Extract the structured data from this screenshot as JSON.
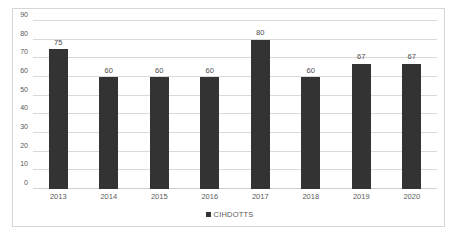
{
  "chart_data": {
    "type": "bar",
    "title": "",
    "subtitle": "",
    "xlabel": "",
    "ylabel": "",
    "categories": [
      "2013",
      "2014",
      "2015",
      "2016",
      "2017",
      "2018",
      "2019",
      "2020"
    ],
    "values": [
      75,
      60,
      60,
      60,
      80,
      60,
      67,
      67
    ],
    "series": [
      {
        "name": "CIHDOTTS",
        "values": [
          75,
          60,
          60,
          60,
          80,
          60,
          67,
          67
        ],
        "color": "#333333"
      }
    ],
    "data_labels": [
      "75",
      "60",
      "60",
      "60",
      "80",
      "60",
      "67",
      "67"
    ],
    "ylim": [
      0,
      90
    ],
    "ytick_values": [
      0,
      10,
      20,
      30,
      40,
      50,
      60,
      70,
      80,
      90
    ],
    "ytick_labels": [
      "0",
      "10",
      "20",
      "30",
      "40",
      "50",
      "60",
      "70",
      "80",
      "90"
    ],
    "grid": true,
    "grid_axis": "y",
    "legend": {
      "position": "bottom",
      "entries": [
        {
          "label": "CIHDOTTS",
          "marker": "square",
          "color": "#333333"
        }
      ]
    },
    "colors": {
      "bar": "#333333",
      "gridline": "#d9d9d9",
      "axis_text": "#5a5a5a",
      "label_text": "#4d4d4d",
      "border": "#d6d6d6",
      "background": "#ffffff"
    }
  }
}
